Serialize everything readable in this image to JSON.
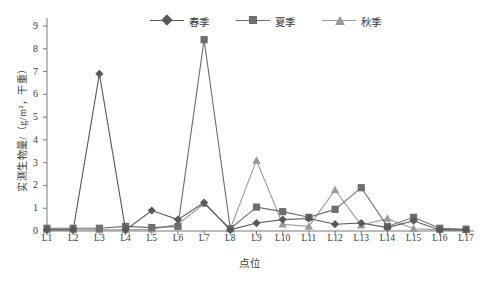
{
  "chart_data": {
    "type": "line",
    "title": "",
    "xlabel": "点位",
    "ylabel": "实测生物量/（g/m²，干重）",
    "categories": [
      "L1",
      "L2",
      "L3",
      "L4",
      "L5",
      "L6",
      "L7",
      "L8",
      "L9",
      "L10",
      "L11",
      "L12",
      "L13",
      "L14",
      "L15",
      "L16",
      "L17"
    ],
    "ylim": [
      0,
      9
    ],
    "ytick_values": [
      0,
      1,
      2,
      3,
      4,
      5,
      6,
      7,
      8,
      9
    ],
    "grid": false,
    "legend_position": "top-center",
    "series": [
      {
        "name": "春季",
        "marker": "diamond",
        "color": "#595959",
        "values": [
          0.05,
          0.05,
          6.9,
          0.05,
          0.9,
          0.5,
          1.25,
          0.05,
          0.35,
          0.5,
          0.55,
          0.3,
          0.35,
          0.15,
          0.45,
          0.05,
          0.05
        ]
      },
      {
        "name": "夏季",
        "marker": "square",
        "color": "#6e6e6e",
        "values": [
          0.12,
          0.12,
          0.12,
          0.2,
          0.15,
          0.2,
          8.4,
          0.1,
          1.05,
          0.85,
          0.6,
          0.95,
          1.9,
          0.2,
          0.6,
          0.12,
          0.08
        ]
      },
      {
        "name": "秋季",
        "marker": "triangle",
        "color": "#9a9a9a",
        "values": [
          0.05,
          0.05,
          0.05,
          0.05,
          0.08,
          0.3,
          1.2,
          0.1,
          3.1,
          0.3,
          0.2,
          1.8,
          0.25,
          0.55,
          0.1,
          0.05,
          0.05
        ]
      }
    ]
  },
  "legend": {
    "items": [
      {
        "label": "春季"
      },
      {
        "label": "夏季"
      },
      {
        "label": "秋季"
      }
    ]
  }
}
